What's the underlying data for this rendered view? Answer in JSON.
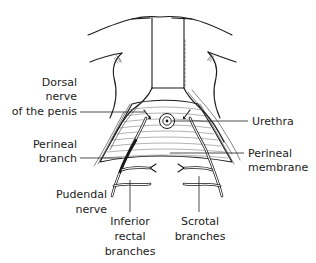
{
  "figure": {
    "colors": {
      "ink": "#1a1a1a",
      "background": "#ffffff",
      "label": "#222222"
    },
    "labels": {
      "dorsal_nerve": {
        "line1": "Dorsal",
        "line2": "nerve",
        "line3": "of the penis"
      },
      "urethra": {
        "line1": "Urethra"
      },
      "perineal_branch": {
        "line1": "Perineal",
        "line2": "branch"
      },
      "perineal_membrane": {
        "line1": "Perineal",
        "line2": "membrane"
      },
      "pudendal_nerve": {
        "line1": "Pudendal",
        "line2": "nerve"
      },
      "inferior_rectal": {
        "line1": "Inferior",
        "line2": "rectal",
        "line3": "branches"
      },
      "scrotal_branches": {
        "line1": "Scrotal",
        "line2": "branches"
      }
    }
  }
}
